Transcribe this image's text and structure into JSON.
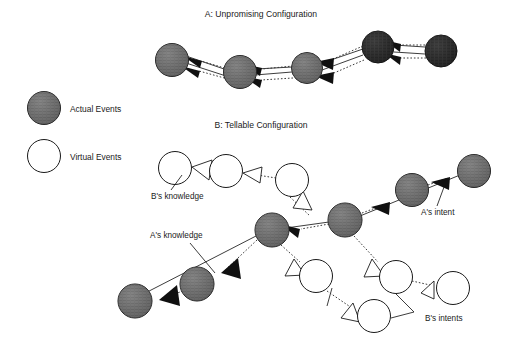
{
  "figure": {
    "section_a": {
      "title": "A: Unpromising Configuration",
      "title_x": 261,
      "title_y": 17,
      "node_fill": "#5e5e5e",
      "node_fill_dark": "#2b2b2b",
      "nodes": [
        {
          "id": "a1",
          "cx": 172,
          "cy": 60,
          "r": 16.5,
          "shade": "mid"
        },
        {
          "id": "a2",
          "cx": 240,
          "cy": 72,
          "r": 16.5,
          "shade": "mid"
        },
        {
          "id": "a3",
          "cx": 307,
          "cy": 68,
          "r": 15.5,
          "shade": "mid"
        },
        {
          "id": "a4",
          "cx": 378,
          "cy": 47,
          "r": 16.0,
          "shade": "dark"
        },
        {
          "id": "a5",
          "cx": 441,
          "cy": 51,
          "r": 16.0,
          "shade": "dark"
        }
      ]
    },
    "section_b": {
      "title": "B: Tellable Configuration",
      "title_x": 261,
      "title_y": 128,
      "labels": [
        {
          "id": "bs-knowledge",
          "text": "B's knowledge",
          "x": 151,
          "y": 196
        },
        {
          "id": "as-intent",
          "text": "A's intent",
          "x": 421,
          "y": 212
        },
        {
          "id": "as-knowledge",
          "text": "A's knowledge",
          "x": 150,
          "y": 238
        },
        {
          "id": "bs-intents",
          "text": "B's intents",
          "x": 425,
          "y": 318
        }
      ],
      "actual_nodes": [
        {
          "id": "b-hub-left",
          "cx": 272,
          "cy": 230,
          "r": 17
        },
        {
          "id": "b-hub-right",
          "cx": 345,
          "cy": 220,
          "r": 17
        },
        {
          "id": "b-intent-1",
          "cx": 412,
          "cy": 190,
          "r": 16.5
        },
        {
          "id": "b-intent-2",
          "cx": 474,
          "cy": 171,
          "r": 16.5
        },
        {
          "id": "b-know-1",
          "cx": 197,
          "cy": 284,
          "r": 17
        },
        {
          "id": "b-know-2",
          "cx": 135,
          "cy": 301,
          "r": 17
        }
      ],
      "virtual_nodes": [
        {
          "id": "v-bk-1",
          "cx": 175,
          "cy": 168,
          "r": 16.5
        },
        {
          "id": "v-bk-2",
          "cx": 226,
          "cy": 171,
          "r": 16.5
        },
        {
          "id": "v-bk-3",
          "cx": 292,
          "cy": 180,
          "r": 16.5
        },
        {
          "id": "v-bi-1",
          "cx": 316,
          "cy": 276,
          "r": 16.5
        },
        {
          "id": "v-bi-2",
          "cx": 396,
          "cy": 277,
          "r": 16.5
        },
        {
          "id": "v-bi-3",
          "cx": 374,
          "cy": 316,
          "r": 16.5
        },
        {
          "id": "v-bi-4",
          "cx": 453,
          "cy": 288,
          "r": 16.5
        }
      ]
    },
    "legend": {
      "actual": {
        "label": "Actual Events",
        "cx": 44,
        "cy": 108,
        "r": 16.5,
        "text_x": 70,
        "text_y": 112
      },
      "virtual": {
        "label": "Virtual Events",
        "cx": 44,
        "cy": 156,
        "r": 16.5,
        "text_x": 70,
        "text_y": 160
      }
    },
    "colors": {
      "stroke": "#1a1a1a",
      "actual_fill": "#6e6e6e",
      "actual_fill_dark": "#2b2b2b",
      "virtual_fill": "#ffffff",
      "solid_arrow": "#111111",
      "hollow_arrow_fill": "#ffffff",
      "background": "#ffffff"
    }
  }
}
